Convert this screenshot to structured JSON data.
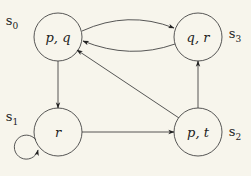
{
  "diagram": {
    "type": "kripke-structure",
    "background": "#f7f5ec",
    "stroke": "#444444",
    "states": [
      {
        "id": "s0",
        "name": "s",
        "sub": "0",
        "label": "p, q",
        "cx": 58,
        "cy": 37,
        "r": 24,
        "name_x": 12,
        "name_y": 22
      },
      {
        "id": "s1",
        "name": "s",
        "sub": "1",
        "label": "r",
        "cx": 58,
        "cy": 132,
        "r": 24,
        "name_x": 12,
        "name_y": 118
      },
      {
        "id": "s2",
        "name": "s",
        "sub": "2",
        "label": "p, t",
        "cx": 198,
        "cy": 132,
        "r": 24,
        "name_x": 235,
        "name_y": 133
      },
      {
        "id": "s3",
        "name": "s",
        "sub": "3",
        "label": "q, r",
        "cx": 198,
        "cy": 37,
        "r": 24,
        "name_x": 235,
        "name_y": 35
      }
    ],
    "transitions": [
      {
        "from": "s0",
        "to": "s3",
        "shape": "curve-upper"
      },
      {
        "from": "s3",
        "to": "s0",
        "shape": "curve-lower"
      },
      {
        "from": "s0",
        "to": "s1",
        "shape": "straight"
      },
      {
        "from": "s1",
        "to": "s1",
        "shape": "self-loop"
      },
      {
        "from": "s1",
        "to": "s2",
        "shape": "straight"
      },
      {
        "from": "s2",
        "to": "s0",
        "shape": "straight"
      },
      {
        "from": "s2",
        "to": "s3",
        "shape": "straight"
      }
    ]
  }
}
